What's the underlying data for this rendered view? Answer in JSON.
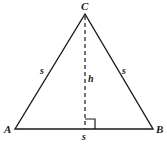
{
  "figure": {
    "name": "equilateral-triangle-with-altitude",
    "background_color": "#ffffff",
    "stroke_color": "#1a1a1a",
    "labels": {
      "vertex_top": "C",
      "vertex_bottom_left": "A",
      "vertex_bottom_right": "B",
      "side_left": "s",
      "side_right": "s",
      "base": "s",
      "height": "h"
    },
    "geometry": {
      "apex": {
        "x": 85,
        "y": 14
      },
      "bottom_left": {
        "x": 15,
        "y": 129
      },
      "bottom_right": {
        "x": 153,
        "y": 129
      },
      "foot_of_altitude": {
        "x": 85,
        "y": 129
      },
      "right_angle_marker": {
        "x": 85,
        "y": 119,
        "size": 10
      },
      "altitude_style": "dashed"
    }
  }
}
